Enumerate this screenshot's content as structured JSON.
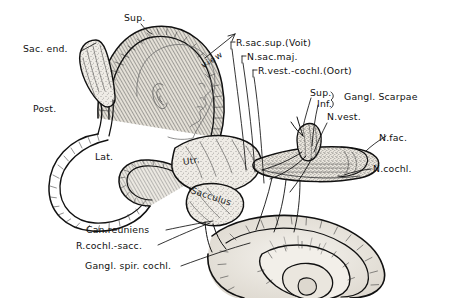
{
  "figure": {
    "background_color": "#ffffff",
    "ink_color": "#111111",
    "tint_color": "#d8d4cc"
  },
  "labels": {
    "sup_canal": "Sup.",
    "sac_end": "Sac. end.",
    "post_canal": "Post.",
    "lat_canal": "Lat.",
    "view": "view",
    "r_sac_sup": "R.sac.sup.(Voit)",
    "n_sac_maj": "N.sac.maj.",
    "r_vest_cochl": "R.vest.-cochl.(Oort)",
    "sup_branch": "Sup.",
    "inf_branch": "Inf.",
    "gangl_scarpae": "Gangl. Scarpae",
    "n_vest": "N.vest.",
    "n_fac": "N.fac.",
    "n_cochl": "N.cochl.",
    "utriculus": "Utr.",
    "sacculus": "Sacculus",
    "can_reuniens": "Can.reuniens",
    "r_cochl_sacc": "R.cochl.-sacc.",
    "gangl_spir_cochl": "Gangl. spir. cochl."
  },
  "structures": [
    {
      "name": "superior-semicircular-canal",
      "label": "Sup."
    },
    {
      "name": "endolymphatic-sac",
      "label": "Sac. end."
    },
    {
      "name": "posterior-semicircular-canal",
      "label": "Post."
    },
    {
      "name": "lateral-semicircular-canal",
      "label": "Lat."
    },
    {
      "name": "utricle",
      "label": "Utr."
    },
    {
      "name": "saccule",
      "label": "Sacculus"
    },
    {
      "name": "cochlea",
      "label": "Gangl. spir. cochl."
    },
    {
      "name": "vestibular-nerve",
      "label": "N.vest."
    },
    {
      "name": "facial-nerve",
      "label": "N.fac."
    },
    {
      "name": "cochlear-nerve",
      "label": "N.cochl."
    },
    {
      "name": "scarpas-ganglion",
      "label": "Gangl. Scarpae"
    },
    {
      "name": "voit-nerve",
      "label": "R.sac.sup.(Voit)"
    },
    {
      "name": "major-saccular-nerve",
      "label": "N.sac.maj."
    },
    {
      "name": "oort-anastomosis",
      "label": "R.vest.-cochl.(Oort)"
    },
    {
      "name": "ductus-reuniens",
      "label": "Can.reuniens"
    },
    {
      "name": "cochleosaccular-duct",
      "label": "R.cochl.-sacc."
    },
    {
      "name": "head-orientation-inset",
      "label": "view"
    }
  ]
}
